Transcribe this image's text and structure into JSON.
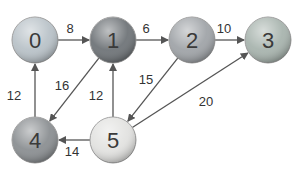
{
  "diagram": {
    "type": "directed-weighted-graph",
    "nodes": [
      {
        "id": "0",
        "label": "0",
        "x": 35,
        "y": 40,
        "r": 23,
        "fill": "#b9c2c8",
        "theme": "photo-thumbnail"
      },
      {
        "id": "1",
        "label": "1",
        "x": 113,
        "y": 40,
        "r": 23,
        "fill": "#6f7478",
        "theme": "photo-thumbnail"
      },
      {
        "id": "2",
        "label": "2",
        "x": 192,
        "y": 40,
        "r": 23,
        "fill": "#a0a4a8",
        "theme": "photo-thumbnail"
      },
      {
        "id": "3",
        "label": "3",
        "x": 268,
        "y": 40,
        "r": 23,
        "fill": "#a8b4ae",
        "theme": "photo-thumbnail"
      },
      {
        "id": "4",
        "label": "4",
        "x": 35,
        "y": 140,
        "r": 23,
        "fill": "#8b8f92",
        "theme": "photo-thumbnail"
      },
      {
        "id": "5",
        "label": "5",
        "x": 113,
        "y": 140,
        "r": 23,
        "fill": "#e2e2e0",
        "theme": "photo-thumbnail"
      }
    ],
    "edges": [
      {
        "from": "0",
        "to": "1",
        "weight": "8",
        "lx": 70,
        "ly": 33
      },
      {
        "from": "1",
        "to": "2",
        "weight": "6",
        "lx": 146,
        "ly": 33
      },
      {
        "from": "2",
        "to": "3",
        "weight": "10",
        "lx": 224,
        "ly": 33
      },
      {
        "from": "1",
        "to": "4",
        "weight": "16",
        "lx": 62,
        "ly": 90
      },
      {
        "from": "4",
        "to": "0",
        "weight": "12",
        "lx": 14,
        "ly": 100
      },
      {
        "from": "5",
        "to": "1",
        "weight": "12",
        "lx": 96,
        "ly": 100
      },
      {
        "from": "2",
        "to": "5",
        "weight": "15",
        "lx": 146,
        "ly": 84
      },
      {
        "from": "5",
        "to": "3",
        "weight": "20",
        "lx": 206,
        "ly": 106
      },
      {
        "from": "5",
        "to": "4",
        "weight": "14",
        "lx": 72,
        "ly": 156
      }
    ],
    "colors": {
      "edge": "#555555",
      "label": "#333333",
      "background": "#ffffff"
    }
  }
}
